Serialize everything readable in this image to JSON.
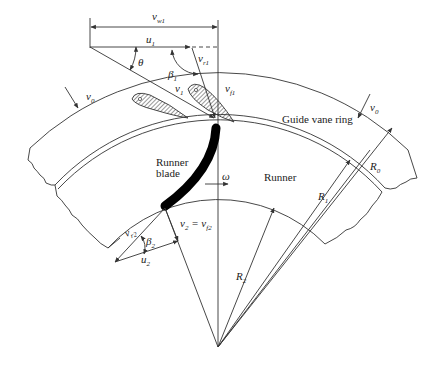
{
  "diagram": {
    "type": "radial-flow turbine velocity triangles",
    "labels": {
      "v_w1": "v",
      "v_w1_sub": "w1",
      "u1": "u",
      "u1_sub": "1",
      "theta": "θ",
      "beta1": "β",
      "beta1_sub": "1",
      "v_r1": "v",
      "v_r1_sub": "r1",
      "v1": "v",
      "v1_sub": "1",
      "v_f1": "v",
      "v_f1_sub": "f1",
      "v0_left": "v",
      "v0_left_sub": "0",
      "v0_right": "v",
      "v0_right_sub": "0",
      "guide_vane_ring": "Guide vane ring",
      "runner_blade_line1": "Runner",
      "runner_blade_line2": "blade",
      "omega": "ω",
      "runner": "Runner",
      "R0": "R",
      "R0_sub": "0",
      "R1": "R",
      "R1_sub": "1",
      "R2": "R",
      "R2_sub": "2",
      "v_r2": "v",
      "v_r2_sub": "r2",
      "beta2": "β",
      "beta2_sub": "2",
      "u2": "u",
      "u2_sub": "2",
      "v2_eq": "v",
      "v2_eq_sub": "2",
      "v2_eq_mid": " = v",
      "v2_eq_sub2": "f2"
    },
    "colors": {
      "line": "#333333",
      "blade": "#000000",
      "background": "#ffffff"
    }
  }
}
